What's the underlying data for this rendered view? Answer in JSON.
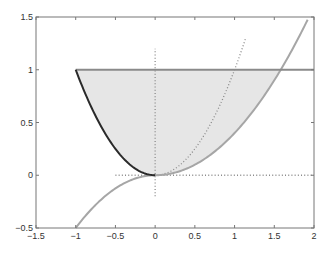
{
  "chart_data": {
    "type": "line",
    "title": "",
    "xlabel": "",
    "ylabel": "",
    "xlim": [
      -1.5,
      2
    ],
    "ylim": [
      -0.5,
      1.5
    ],
    "grid": false,
    "legend": null,
    "xticks": [
      "-1.5",
      "-1",
      "-0.5",
      "0",
      "0.5",
      "1",
      "1.5",
      "2"
    ],
    "yticks": [
      "-0.5",
      "0",
      "0.5",
      "1",
      "1.5"
    ],
    "series": [
      {
        "name": "dark-curve",
        "style": "solid-dark",
        "description": "y = x^2 for x in [-1, 0]",
        "x": [
          -1,
          -0.75,
          -0.5,
          -0.25,
          0
        ],
        "y": [
          1,
          0.5625,
          0.25,
          0.0625,
          0
        ]
      },
      {
        "name": "horizontal-line",
        "style": "solid-gray",
        "description": "y = 1 for x in [-1, 2]",
        "x": [
          -1,
          2
        ],
        "y": [
          1,
          1
        ]
      },
      {
        "name": "gray-curve",
        "style": "solid-light-gray",
        "x": [
          -1,
          -0.5,
          0,
          0.5,
          1,
          1.57,
          1.94
        ],
        "y": [
          -0.5,
          -0.125,
          0,
          0.1,
          0.4,
          1,
          1.5
        ]
      },
      {
        "name": "dotted-parabola",
        "style": "dotted",
        "description": "y = x^2 for x in [0, 1.15]",
        "x": [
          0,
          0.5,
          1,
          1.15
        ],
        "y": [
          0,
          0.25,
          1,
          1.33
        ]
      },
      {
        "name": "dotted-vertical-axis",
        "style": "dotted",
        "x": [
          0,
          0
        ],
        "y": [
          -0.2,
          1.2
        ]
      },
      {
        "name": "dotted-horizontal-axis",
        "style": "dotted",
        "x": [
          -0.5,
          2
        ],
        "y": [
          0,
          0
        ]
      }
    ],
    "shaded_region": {
      "description": "Region between y=1 and the lower boundary (dark curve for x<0, gray curve for x>0)",
      "color": "#e6e6e6"
    }
  },
  "colors": {
    "dark": "#2a2a2a",
    "gray": "#8a8a8a",
    "light_gray": "#a6a6a6",
    "fill": "#e6e6e6",
    "axes": "#777777"
  }
}
